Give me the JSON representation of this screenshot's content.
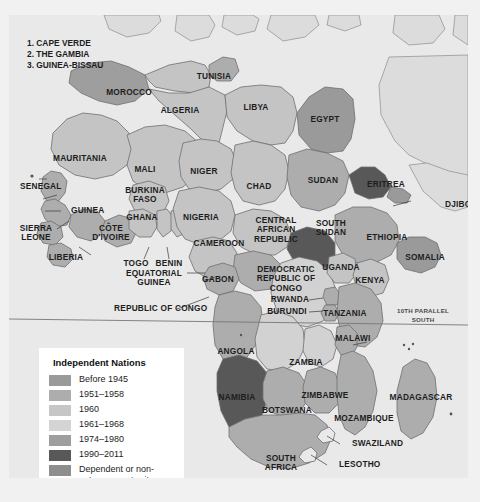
{
  "map": {
    "title": "Independence of African Nations",
    "index_notes": [
      "1. CAPE VERDE",
      "2. THE GAMBIA",
      "3. GUINEA-BISSAU"
    ],
    "parallel_label": "10TH PARALLEL\nSOUTH",
    "colors": {
      "ocean": "#e9e9e9",
      "outside_land": "#dcdcdc",
      "before_1945": "#9a9a9a",
      "y1951_1958": "#adadad",
      "y1960": "#c4c4c4",
      "y1961_1968": "#d2d2d2",
      "y1974_1980": "#9e9e9e",
      "y1990_2011": "#585858",
      "dependent": "#8e8e8e",
      "border": "#6e6e6e",
      "leader": "#3a3a3a",
      "text": "#1d1d1d"
    },
    "countries": [
      {
        "name": "MOROCCO",
        "x": 120,
        "y": 78,
        "class": ""
      },
      {
        "name": "TUNISIA",
        "x": 205,
        "y": 62,
        "class": ""
      },
      {
        "name": "ALGERIA",
        "x": 171,
        "y": 96,
        "class": ""
      },
      {
        "name": "LIBYA",
        "x": 247,
        "y": 93,
        "class": ""
      },
      {
        "name": "EGYPT",
        "x": 316,
        "y": 105,
        "class": ""
      },
      {
        "name": "MAURITANIA",
        "x": 71,
        "y": 144,
        "class": ""
      },
      {
        "name": "MALI",
        "x": 136,
        "y": 155,
        "class": ""
      },
      {
        "name": "NIGER",
        "x": 195,
        "y": 157,
        "class": ""
      },
      {
        "name": "CHAD",
        "x": 250,
        "y": 172,
        "class": ""
      },
      {
        "name": "SUDAN",
        "x": 314,
        "y": 166,
        "class": ""
      },
      {
        "name": "ERITREA",
        "x": 377,
        "y": 170,
        "class": ""
      },
      {
        "name": "DJIBOUTI",
        "x": 436,
        "y": 190,
        "class": "lft"
      },
      {
        "name": "SENEGAL",
        "x": 11,
        "y": 172,
        "class": "lft"
      },
      {
        "name": "GUINEA",
        "x": 62,
        "y": 196,
        "class": "lft"
      },
      {
        "name": "BURKINA\nFASO",
        "x": 136,
        "y": 180,
        "class": ""
      },
      {
        "name": "GHANA",
        "x": 133,
        "y": 203,
        "class": ""
      },
      {
        "name": "NIGERIA",
        "x": 192,
        "y": 203,
        "class": ""
      },
      {
        "name": "CENTRAL\nAFRICAN\nREPUBLIC",
        "x": 267,
        "y": 215,
        "class": ""
      },
      {
        "name": "SOUTH\nSUDAN",
        "x": 322,
        "y": 213,
        "class": ""
      },
      {
        "name": "ETHIOPIA",
        "x": 378,
        "y": 223,
        "class": ""
      },
      {
        "name": "SIERRA\nLEONE",
        "x": 27,
        "y": 218,
        "class": ""
      },
      {
        "name": "CÔTE\nD'IVOIRE",
        "x": 102,
        "y": 218,
        "class": ""
      },
      {
        "name": "LIBERIA",
        "x": 57,
        "y": 243,
        "class": ""
      },
      {
        "name": "CAMEROON",
        "x": 210,
        "y": 229,
        "class": ""
      },
      {
        "name": "SOMALIA",
        "x": 416,
        "y": 243,
        "class": ""
      },
      {
        "name": "TOGO",
        "x": 127,
        "y": 249,
        "class": ""
      },
      {
        "name": "BENIN",
        "x": 160,
        "y": 249,
        "class": ""
      },
      {
        "name": "EQUATORIAL\nGUINEA",
        "x": 145,
        "y": 263,
        "class": ""
      },
      {
        "name": "GABON",
        "x": 209,
        "y": 265,
        "class": ""
      },
      {
        "name": "DEMOCRATIC\nREPUBLIC OF\nCONGO",
        "x": 277,
        "y": 264,
        "class": ""
      },
      {
        "name": "UGANDA",
        "x": 332,
        "y": 253,
        "class": ""
      },
      {
        "name": "KENYA",
        "x": 361,
        "y": 266,
        "class": ""
      },
      {
        "name": "RWANDA",
        "x": 281,
        "y": 285,
        "class": ""
      },
      {
        "name": "BURUNDI",
        "x": 278,
        "y": 297,
        "class": ""
      },
      {
        "name": "TANZANIA",
        "x": 336,
        "y": 299,
        "class": ""
      },
      {
        "name": "REPUBLIC OF CONGO",
        "x": 105,
        "y": 294,
        "class": "lft"
      },
      {
        "name": "ANGOLA",
        "x": 227,
        "y": 337,
        "class": ""
      },
      {
        "name": "MALAWI",
        "x": 344,
        "y": 324,
        "class": ""
      },
      {
        "name": "ZAMBIA",
        "x": 297,
        "y": 348,
        "class": ""
      },
      {
        "name": "NAMIBIA",
        "x": 228,
        "y": 383,
        "class": ""
      },
      {
        "name": "ZIMBABWE",
        "x": 316,
        "y": 381,
        "class": ""
      },
      {
        "name": "BOTSWANA",
        "x": 278,
        "y": 396,
        "class": ""
      },
      {
        "name": "MOZAMBIQUE",
        "x": 355,
        "y": 404,
        "class": ""
      },
      {
        "name": "MADAGASCAR",
        "x": 412,
        "y": 383,
        "class": ""
      },
      {
        "name": "SWAZILAND",
        "x": 343,
        "y": 429,
        "class": "lft"
      },
      {
        "name": "SOUTH\nAFRICA",
        "x": 272,
        "y": 448,
        "class": ""
      },
      {
        "name": "LESOTHO",
        "x": 330,
        "y": 450,
        "class": "lft"
      }
    ]
  },
  "legend": {
    "title": "Independent Nations",
    "items": [
      {
        "label": "Before 1945",
        "color": "#9a9a9a"
      },
      {
        "label": "1951–1958",
        "color": "#adadad"
      },
      {
        "label": "1960",
        "color": "#c6c6c6"
      },
      {
        "label": "1961–1968",
        "color": "#d4d4d4"
      },
      {
        "label": "1974–1980",
        "color": "#9e9e9e"
      },
      {
        "label": "1990–2011",
        "color": "#585858"
      },
      {
        "label": "Dependent or non-\nautonomous territory",
        "color": "#8e8e8e"
      }
    ]
  }
}
